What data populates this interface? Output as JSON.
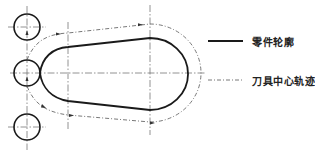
{
  "diagram": {
    "type": "cnc-tool-path-diagram",
    "colors": {
      "part_contour": "#1a1a1a",
      "tool_path": "#555555",
      "centerline": "#666666",
      "text": "#222222"
    },
    "legend": {
      "items": [
        {
          "label": "零件轮廓",
          "style": "solid-thick"
        },
        {
          "label": "刀具中心轨迹",
          "style": "dash-dot-thin"
        }
      ]
    },
    "elements": {
      "tool_positions": [
        {
          "name": "tool-circle-top"
        },
        {
          "name": "tool-circle-middle"
        },
        {
          "name": "tool-circle-bottom"
        }
      ]
    }
  }
}
